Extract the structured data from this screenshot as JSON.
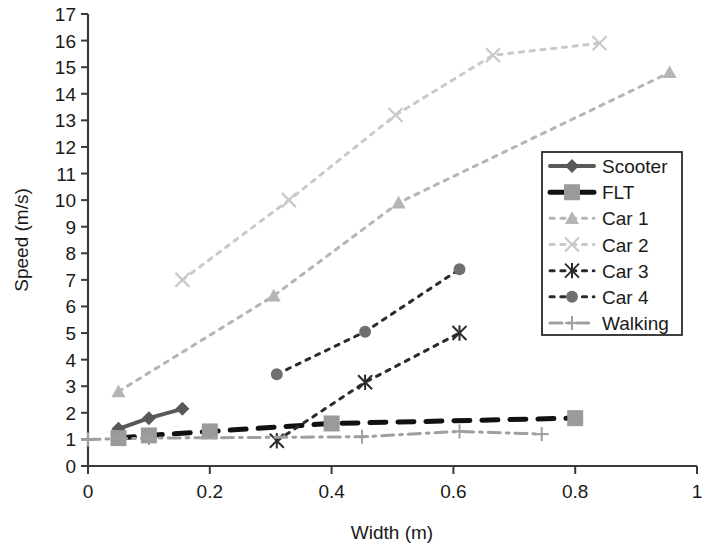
{
  "chart_data": {
    "type": "line",
    "title": "",
    "xlabel": "Width (m)",
    "ylabel": "Speed (m/s)",
    "xlim": [
      0,
      1
    ],
    "ylim": [
      0,
      17
    ],
    "xticks": [
      "0",
      "0.2",
      "0.4",
      "0.6",
      "0.8",
      "1"
    ],
    "xtick_values": [
      0,
      0.2,
      0.4,
      0.6,
      0.8,
      1
    ],
    "yticks": [
      "0",
      "1",
      "2",
      "3",
      "4",
      "5",
      "6",
      "7",
      "8",
      "9",
      "10",
      "11",
      "12",
      "13",
      "14",
      "15",
      "16",
      "17"
    ],
    "ytick_values": [
      0,
      1,
      2,
      3,
      4,
      5,
      6,
      7,
      8,
      9,
      10,
      11,
      12,
      13,
      14,
      15,
      16,
      17
    ],
    "grid": false,
    "legend_position": "right-middle",
    "series": [
      {
        "name": "Scooter",
        "marker": "diamond",
        "linestyle": "solid",
        "color": "#595959",
        "x": [
          0.05,
          0.1,
          0.155
        ],
        "y": [
          1.4,
          1.8,
          2.15
        ]
      },
      {
        "name": "FLT",
        "marker": "square",
        "linestyle": "dashed",
        "color": "#111111",
        "marker_color": "#9a9a9a",
        "x": [
          0.05,
          0.1,
          0.2,
          0.4,
          0.8
        ],
        "y": [
          1.05,
          1.15,
          1.3,
          1.6,
          1.8
        ]
      },
      {
        "name": "Car 1",
        "marker": "triangle",
        "linestyle": "dotted",
        "color": "#b5b5b5",
        "x": [
          0.05,
          0.305,
          0.51,
          0.955
        ],
        "y": [
          2.8,
          6.4,
          9.9,
          14.8
        ]
      },
      {
        "name": "Car 2",
        "marker": "x",
        "linestyle": "dotted",
        "color": "#c9c9c9",
        "x": [
          0.155,
          0.33,
          0.505,
          0.665,
          0.84
        ],
        "y": [
          7.0,
          10.0,
          13.2,
          15.45,
          15.9
        ]
      },
      {
        "name": "Car 3",
        "marker": "asterisk",
        "linestyle": "dotted",
        "color": "#2b2b2b",
        "x": [
          0.31,
          0.455,
          0.61
        ],
        "y": [
          0.95,
          3.15,
          5.0
        ]
      },
      {
        "name": "Car 4",
        "marker": "circle",
        "linestyle": "dotted",
        "color": "#2b2b2b",
        "marker_color": "#6f6f6f",
        "x": [
          0.31,
          0.455,
          0.61
        ],
        "y": [
          3.45,
          5.05,
          7.4
        ]
      },
      {
        "name": "Walking",
        "marker": "plus",
        "linestyle": "dashdot",
        "color": "#9f9f9f",
        "x": [
          0.0,
          0.1,
          0.45,
          0.61,
          0.745
        ],
        "y": [
          1.0,
          1.05,
          1.1,
          1.3,
          1.2
        ]
      }
    ]
  },
  "legend": {
    "entries": [
      {
        "label": "Scooter"
      },
      {
        "label": "FLT"
      },
      {
        "label": "Car 1"
      },
      {
        "label": "Car 2"
      },
      {
        "label": "Car 3"
      },
      {
        "label": "Car 4"
      },
      {
        "label": "Walking"
      }
    ]
  },
  "colors": {
    "axis": "#3b3b3b",
    "text": "#1a1a1a",
    "background": "#ffffff"
  }
}
